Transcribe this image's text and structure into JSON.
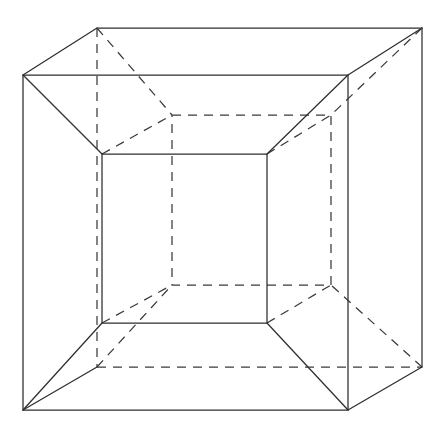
{
  "figure": {
    "name": "tesseract-projection",
    "background_color": "#ffffff",
    "stroke_color": "#2e2e2e",
    "stroke_width": 1.25,
    "dash_pattern": "9 7",
    "canvas": {
      "width": 446,
      "height": 436
    }
  },
  "geometry": {
    "outer_cube": {
      "label": "outer-cube",
      "front_face": {
        "label": "outer-front-face",
        "style": "solid",
        "vertices": [
          {
            "name": "outer-front-top-left",
            "x": 23,
            "y": 75
          },
          {
            "name": "outer-front-top-right",
            "x": 348,
            "y": 75
          },
          {
            "name": "outer-front-bottom-right",
            "x": 348,
            "y": 410
          },
          {
            "name": "outer-front-bottom-left",
            "x": 23,
            "y": 410
          }
        ]
      },
      "back_face": {
        "label": "outer-back-face",
        "vertices": [
          {
            "name": "outer-back-top-left",
            "x": 97,
            "y": 28
          },
          {
            "name": "outer-back-top-right",
            "x": 422,
            "y": 28
          },
          {
            "name": "outer-back-bottom-right",
            "x": 422,
            "y": 367
          },
          {
            "name": "outer-back-bottom-left",
            "x": 97,
            "y": 367
          }
        ],
        "solid_edges": [
          {
            "name": "outer-back-top-edge",
            "from": [
              97,
              28
            ],
            "to": [
              422,
              28
            ]
          },
          {
            "name": "outer-back-right-edge",
            "from": [
              422,
              28
            ],
            "to": [
              422,
              367
            ]
          }
        ],
        "dashed_edges": [
          {
            "name": "outer-back-left-edge",
            "from": [
              97,
              28
            ],
            "to": [
              97,
              367
            ]
          },
          {
            "name": "outer-back-bottom-edge",
            "from": [
              97,
              367
            ],
            "to": [
              422,
              367
            ]
          }
        ]
      },
      "connecting_edges": [
        {
          "name": "outer-connector-top-left",
          "style": "solid",
          "from": [
            23,
            75
          ],
          "to": [
            97,
            28
          ]
        },
        {
          "name": "outer-connector-top-right",
          "style": "solid",
          "from": [
            348,
            75
          ],
          "to": [
            422,
            28
          ]
        },
        {
          "name": "outer-connector-bottom-right",
          "style": "solid",
          "from": [
            348,
            410
          ],
          "to": [
            422,
            367
          ]
        },
        {
          "name": "outer-connector-bottom-left",
          "style": "solid",
          "from": [
            23,
            410
          ],
          "to": [
            97,
            367
          ]
        }
      ]
    },
    "inner_cube": {
      "label": "inner-cube",
      "front_face": {
        "label": "inner-front-face",
        "style": "solid",
        "vertices": [
          {
            "name": "inner-front-top-left",
            "x": 102,
            "y": 154
          },
          {
            "name": "inner-front-top-right",
            "x": 267,
            "y": 154
          },
          {
            "name": "inner-front-bottom-right",
            "x": 267,
            "y": 323
          },
          {
            "name": "inner-front-bottom-left",
            "x": 102,
            "y": 323
          }
        ]
      },
      "back_face": {
        "label": "inner-back-face",
        "style": "dashed",
        "vertices": [
          {
            "name": "inner-back-top-left",
            "x": 172,
            "y": 115
          },
          {
            "name": "inner-back-top-right",
            "x": 331,
            "y": 115
          },
          {
            "name": "inner-back-bottom-right",
            "x": 331,
            "y": 285
          },
          {
            "name": "inner-back-bottom-left",
            "x": 172,
            "y": 285
          }
        ]
      },
      "connecting_edges": [
        {
          "name": "inner-connector-top-left",
          "style": "dashed",
          "from": [
            102,
            154
          ],
          "to": [
            172,
            115
          ]
        },
        {
          "name": "inner-connector-top-right",
          "style": "dashed",
          "from": [
            267,
            154
          ],
          "to": [
            331,
            115
          ]
        },
        {
          "name": "inner-connector-bottom-right",
          "style": "dashed",
          "from": [
            267,
            323
          ],
          "to": [
            331,
            285
          ]
        },
        {
          "name": "inner-connector-bottom-left",
          "style": "dashed",
          "from": [
            102,
            323
          ],
          "to": [
            172,
            285
          ]
        }
      ]
    },
    "hyper_edges": {
      "label": "hyper-connecting-edges",
      "description": "Edges joining each outer cube vertex to its corresponding inner cube vertex.",
      "edges": [
        {
          "name": "hyper-edge-front-top-left",
          "style": "solid",
          "from": [
            23,
            75
          ],
          "to": [
            102,
            154
          ]
        },
        {
          "name": "hyper-edge-front-top-right",
          "style": "solid",
          "from": [
            348,
            75
          ],
          "to": [
            267,
            154
          ]
        },
        {
          "name": "hyper-edge-front-bottom-right",
          "style": "solid",
          "from": [
            348,
            410
          ],
          "to": [
            267,
            323
          ]
        },
        {
          "name": "hyper-edge-front-bottom-left",
          "style": "solid",
          "from": [
            23,
            410
          ],
          "to": [
            102,
            323
          ]
        },
        {
          "name": "hyper-edge-back-top-left",
          "style": "dashed",
          "from": [
            97,
            28
          ],
          "to": [
            172,
            115
          ]
        },
        {
          "name": "hyper-edge-back-top-right",
          "style": "dashed",
          "from": [
            422,
            28
          ],
          "to": [
            331,
            115
          ]
        },
        {
          "name": "hyper-edge-back-bottom-right",
          "style": "dashed",
          "from": [
            422,
            367
          ],
          "to": [
            331,
            285
          ]
        },
        {
          "name": "hyper-edge-back-bottom-left",
          "style": "dashed",
          "from": [
            97,
            367
          ],
          "to": [
            172,
            285
          ]
        }
      ]
    }
  }
}
